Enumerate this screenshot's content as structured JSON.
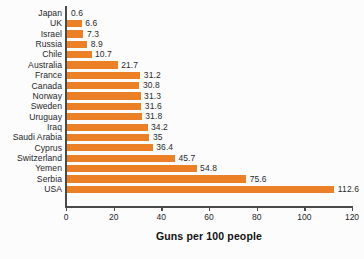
{
  "chart_data": {
    "type": "bar",
    "orientation": "horizontal",
    "title": "",
    "xlabel": "Guns per 100 people",
    "ylabel": "",
    "xlim": [
      0,
      120
    ],
    "xticks": [
      0,
      20,
      40,
      60,
      80,
      100,
      120
    ],
    "grid": false,
    "legend": null,
    "bar_color": "#ec8026",
    "categories": [
      "Japan",
      "UK",
      "Israel",
      "Russia",
      "Chile",
      "Australia",
      "France",
      "Canada",
      "Norway",
      "Sweden",
      "Uruguay",
      "Iraq",
      "Saudi Arabia",
      "Cyprus",
      "Switzerland",
      "Yemen",
      "Serbia",
      "USA"
    ],
    "values": [
      0.6,
      6.6,
      7.3,
      8.9,
      10.7,
      21.7,
      31.2,
      30.8,
      31.3,
      31.6,
      31.8,
      34.2,
      35,
      36.4,
      45.7,
      54.8,
      75.6,
      112.6
    ],
    "value_labels": [
      "0.6",
      "6.6",
      "7.3",
      "8.9",
      "10.7",
      "21.7",
      "31.2",
      "30.8",
      "31.3",
      "31.6",
      "31.8",
      "34.2",
      "35",
      "36.4",
      "45.7",
      "54.8",
      "75.6",
      "112.6"
    ],
    "bars": [
      {
        "category": "Japan",
        "value": 0.6,
        "label": "0.6"
      },
      {
        "category": "UK",
        "value": 6.6,
        "label": "6.6"
      },
      {
        "category": "Israel",
        "value": 7.3,
        "label": "7.3"
      },
      {
        "category": "Russia",
        "value": 8.9,
        "label": "8.9"
      },
      {
        "category": "Chile",
        "value": 10.7,
        "label": "10.7"
      },
      {
        "category": "Australia",
        "value": 21.7,
        "label": "21.7"
      },
      {
        "category": "France",
        "value": 31.2,
        "label": "31.2"
      },
      {
        "category": "Canada",
        "value": 30.8,
        "label": "30.8"
      },
      {
        "category": "Norway",
        "value": 31.3,
        "label": "31.3"
      },
      {
        "category": "Sweden",
        "value": 31.6,
        "label": "31.6"
      },
      {
        "category": "Uruguay",
        "value": 31.8,
        "label": "31.8"
      },
      {
        "category": "Iraq",
        "value": 34.2,
        "label": "34.2"
      },
      {
        "category": "Saudi Arabia",
        "value": 35,
        "label": "35"
      },
      {
        "category": "Cyprus",
        "value": 36.4,
        "label": "36.4"
      },
      {
        "category": "Switzerland",
        "value": 45.7,
        "label": "45.7"
      },
      {
        "category": "Yemen",
        "value": 54.8,
        "label": "54.8"
      },
      {
        "category": "Serbia",
        "value": 75.6,
        "label": "75.6"
      },
      {
        "category": "USA",
        "value": 112.6,
        "label": "112.6"
      }
    ]
  }
}
